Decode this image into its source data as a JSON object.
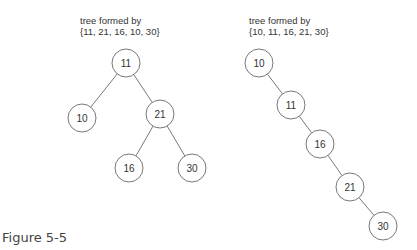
{
  "left_tree": {
    "caption_line1": "tree formed by",
    "caption_line2": "{11, 21, 16, 10, 30}",
    "nodes": [
      {
        "label": "11",
        "x": 126,
        "y": 63
      },
      {
        "label": "10",
        "x": 82,
        "y": 118
      },
      {
        "label": "21",
        "x": 160,
        "y": 114
      },
      {
        "label": "16",
        "x": 129,
        "y": 168
      },
      {
        "label": "30",
        "x": 192,
        "y": 168
      }
    ],
    "edges": [
      [
        0,
        1
      ],
      [
        0,
        2
      ],
      [
        2,
        3
      ],
      [
        2,
        4
      ]
    ]
  },
  "right_tree": {
    "caption_line1": "tree formed by",
    "caption_line2": "{10, 11, 16, 21, 30}",
    "nodes": [
      {
        "label": "10",
        "x": 259,
        "y": 63
      },
      {
        "label": "11",
        "x": 291,
        "y": 105
      },
      {
        "label": "16",
        "x": 320,
        "y": 144
      },
      {
        "label": "21",
        "x": 350,
        "y": 187
      },
      {
        "label": "30",
        "x": 383,
        "y": 226
      }
    ],
    "edges": [
      [
        0,
        1
      ],
      [
        1,
        2
      ],
      [
        2,
        3
      ],
      [
        3,
        4
      ]
    ]
  },
  "figure_label": "Figure 5-5",
  "style": {
    "stroke": "#555555",
    "node_radius": 14
  }
}
